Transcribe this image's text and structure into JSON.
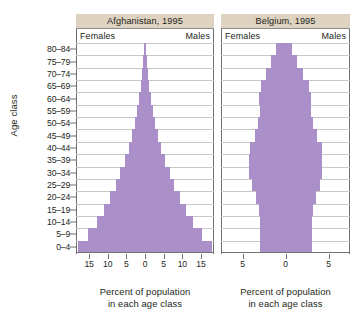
{
  "figure": {
    "yaxis_title": "Age class",
    "bar_color": "#ab8fc8",
    "header_band_color": "#ded3c0",
    "gridline_color": "#c8c8c8",
    "axis_color": "#6f6f6f"
  },
  "age_classes": [
    "0–4",
    "5–9",
    "10–14",
    "15–19",
    "20–24",
    "25–29",
    "30–34",
    "35–39",
    "40–44",
    "45–49",
    "50–54",
    "55–59",
    "60–64",
    "65–69",
    "70–74",
    "75–79",
    "80–84"
  ],
  "panels": [
    {
      "id": "afghanistan",
      "title": "Afghanistan, 1995",
      "left_label": "Females",
      "right_label": "Males",
      "xcaption_line1": "Percent of population",
      "xcaption_line2": "in each age class",
      "xticks": [
        "15",
        "10",
        "5",
        "0",
        "5",
        "10",
        "15"
      ]
    },
    {
      "id": "belgium",
      "title": "Belgium, 1995",
      "left_label": "Females",
      "right_label": "Males",
      "xcaption_line1": "Percent of population",
      "xcaption_line2": "in each age class",
      "xticks": [
        "5",
        "0",
        "5"
      ]
    }
  ],
  "chart_data": [
    {
      "type": "bar",
      "subtype": "population-pyramid",
      "title": "Afghanistan, 1995",
      "xlabel": "Percent of population in each age class",
      "ylabel": "Age class",
      "categories": [
        "0–4",
        "5–9",
        "10–14",
        "15–19",
        "20–24",
        "25–29",
        "30–34",
        "35–39",
        "40–44",
        "45–49",
        "50–54",
        "55–59",
        "60–64",
        "65–69",
        "70–74",
        "75–79",
        "80–84"
      ],
      "series": [
        {
          "name": "Females",
          "side": "left",
          "values": [
            18.0,
            15.2,
            13.0,
            11.0,
            9.3,
            7.9,
            6.6,
            5.4,
            4.4,
            3.5,
            2.8,
            2.1,
            1.6,
            1.1,
            0.8,
            0.5,
            0.3
          ]
        },
        {
          "name": "Males",
          "side": "right",
          "values": [
            18.0,
            15.2,
            13.0,
            11.0,
            9.3,
            7.9,
            6.6,
            5.4,
            4.4,
            3.5,
            2.8,
            2.1,
            1.6,
            1.1,
            0.8,
            0.5,
            0.3
          ]
        }
      ],
      "xtick_values": [
        -15,
        -10,
        -5,
        0,
        5,
        10,
        15
      ],
      "xtick_labels": [
        "15",
        "10",
        "5",
        "0",
        "5",
        "10",
        "15"
      ],
      "xlim": [
        -18.5,
        18.5
      ],
      "grid": true,
      "legend": "inline-top",
      "annotations": [
        "Females",
        "Males"
      ]
    },
    {
      "type": "bar",
      "subtype": "population-pyramid",
      "title": "Belgium, 1995",
      "xlabel": "Percent of population in each age class",
      "ylabel": "Age class",
      "categories": [
        "0–4",
        "5–9",
        "10–14",
        "15–19",
        "20–24",
        "25–29",
        "30–34",
        "35–39",
        "40–44",
        "45–49",
        "50–54",
        "55–59",
        "60–64",
        "65–69",
        "70–74",
        "75–79",
        "80–84"
      ],
      "series": [
        {
          "name": "Females",
          "side": "left",
          "values": [
            3.0,
            3.0,
            3.0,
            3.1,
            3.4,
            3.9,
            4.2,
            4.2,
            4.1,
            3.6,
            3.2,
            3.0,
            3.1,
            2.9,
            2.3,
            1.7,
            1.1
          ]
        },
        {
          "name": "Males",
          "side": "right",
          "values": [
            3.1,
            3.1,
            3.1,
            3.2,
            3.5,
            4.0,
            4.3,
            4.3,
            4.2,
            3.7,
            3.2,
            3.0,
            3.0,
            2.7,
            2.0,
            1.3,
            0.7
          ]
        }
      ],
      "xtick_values": [
        -5,
        0,
        5
      ],
      "xtick_labels": [
        "5",
        "0",
        "5"
      ],
      "xlim": [
        -7.5,
        7.5
      ],
      "grid": true,
      "legend": "inline-top",
      "annotations": [
        "Females",
        "Males"
      ]
    }
  ]
}
